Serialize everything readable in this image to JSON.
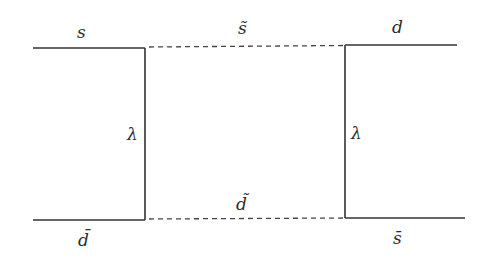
{
  "diagram": {
    "type": "box-feynman-diagram",
    "labels": {
      "top_left_quark": "s",
      "top_squark": "s̃",
      "top_right_quark": "d",
      "left_coupling": "λ",
      "right_coupling": "λ",
      "bottom_left_antiquark": "d̄",
      "bottom_squark": "d̃",
      "bottom_right_antiquark": "s̄"
    },
    "lines": [
      {
        "id": "s-in",
        "style": "solid",
        "from": [
          33,
          48
        ],
        "to": [
          145,
          48
        ]
      },
      {
        "id": "left-vertex",
        "style": "solid",
        "from": [
          145,
          48
        ],
        "to": [
          145,
          220
        ]
      },
      {
        "id": "dbar-in",
        "style": "solid",
        "from": [
          33,
          220
        ],
        "to": [
          145,
          220
        ]
      },
      {
        "id": "s-tilde-propagator",
        "style": "dashed",
        "from": [
          145,
          47
        ],
        "to": [
          345,
          45
        ]
      },
      {
        "id": "d-tilde-propagator",
        "style": "dashed",
        "from": [
          145,
          219
        ],
        "to": [
          345,
          218
        ]
      },
      {
        "id": "right-vertex",
        "style": "solid",
        "from": [
          345,
          45
        ],
        "to": [
          345,
          218
        ]
      },
      {
        "id": "d-out",
        "style": "solid",
        "from": [
          345,
          45
        ],
        "to": [
          457,
          45
        ]
      },
      {
        "id": "sbar-out",
        "style": "solid",
        "from": [
          345,
          218
        ],
        "to": [
          465,
          218
        ]
      }
    ]
  }
}
